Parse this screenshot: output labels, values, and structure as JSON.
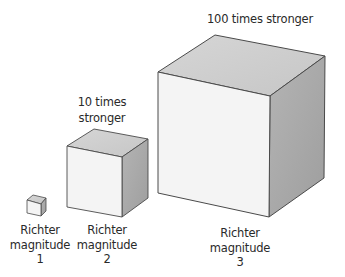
{
  "diagram": {
    "colors": {
      "front": "#f4f4f4",
      "top": "#cfcfcf",
      "side": "#a9a9a9",
      "edge": "#4a4a4a",
      "text": "#2a2a2a"
    },
    "cubes": [
      {
        "id": "magnitude-1",
        "label_line1": "Richter",
        "label_line2": "magnitude",
        "label_line3": "1"
      },
      {
        "id": "magnitude-2",
        "label_line1": "Richter",
        "label_line2": "magnitude",
        "label_line3": "2",
        "annotation_line1": "10 times",
        "annotation_line2": "stronger"
      },
      {
        "id": "magnitude-3",
        "label_line1": "Richter",
        "label_line2": "magnitude",
        "label_line3": "3",
        "annotation_line1": "100 times stronger"
      }
    ]
  }
}
